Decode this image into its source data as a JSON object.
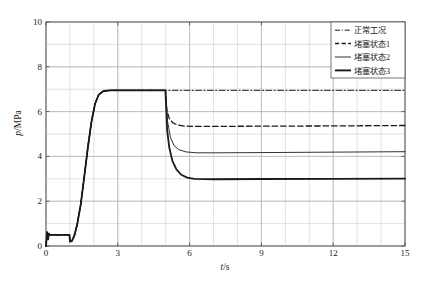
{
  "chart_data": {
    "type": "line",
    "title": "",
    "xlabel": "t/s",
    "ylabel": "p/MPa",
    "xlim": [
      0,
      15
    ],
    "ylim": [
      0,
      10
    ],
    "xticks": [
      0,
      3,
      6,
      9,
      12,
      15
    ],
    "yticks": [
      0,
      2,
      4,
      6,
      8,
      10
    ],
    "xtick_labels": [
      "0",
      "3",
      "6",
      "9",
      "12",
      "15"
    ],
    "ytick_labels": [
      "0",
      "2",
      "4",
      "6",
      "8",
      "10"
    ],
    "grid": true,
    "grid_minor_x_step": 1,
    "grid_minor_y_step": 1,
    "legend_position": "top-right",
    "units": {
      "x": "s",
      "y": "MPa"
    },
    "annotations": {
      "event_time_s": 5.0,
      "startup_plateau_mpa": 0.5,
      "steady_high_mpa": 6.95
    },
    "series": [
      {
        "name": "正常工况",
        "style": "dash-dot",
        "color": "#1a1a1a",
        "width": 1.0,
        "final_value": 6.95,
        "points": [
          [
            0.0,
            0.0
          ],
          [
            0.05,
            0.62
          ],
          [
            0.09,
            0.3
          ],
          [
            0.12,
            0.55
          ],
          [
            0.16,
            0.5
          ],
          [
            0.55,
            0.5
          ],
          [
            0.98,
            0.5
          ],
          [
            1.0,
            0.2
          ],
          [
            1.08,
            0.22
          ],
          [
            1.18,
            0.45
          ],
          [
            1.3,
            0.95
          ],
          [
            1.45,
            1.85
          ],
          [
            1.6,
            3.1
          ],
          [
            1.75,
            4.4
          ],
          [
            1.9,
            5.55
          ],
          [
            2.05,
            6.35
          ],
          [
            2.2,
            6.75
          ],
          [
            2.4,
            6.92
          ],
          [
            2.7,
            6.95
          ],
          [
            3.5,
            6.95
          ],
          [
            5.0,
            6.95
          ],
          [
            7.0,
            6.95
          ],
          [
            10.0,
            6.95
          ],
          [
            15.0,
            6.95
          ]
        ]
      },
      {
        "name": "堵塞状态1",
        "style": "dashed",
        "color": "#1a1a1a",
        "width": 1.3,
        "final_value": 5.35,
        "points": [
          [
            0.0,
            0.0
          ],
          [
            0.05,
            0.62
          ],
          [
            0.09,
            0.3
          ],
          [
            0.12,
            0.55
          ],
          [
            0.16,
            0.5
          ],
          [
            0.55,
            0.5
          ],
          [
            0.98,
            0.5
          ],
          [
            1.0,
            0.2
          ],
          [
            1.08,
            0.22
          ],
          [
            1.18,
            0.45
          ],
          [
            1.3,
            0.95
          ],
          [
            1.45,
            1.85
          ],
          [
            1.6,
            3.1
          ],
          [
            1.75,
            4.4
          ],
          [
            1.9,
            5.55
          ],
          [
            2.05,
            6.35
          ],
          [
            2.2,
            6.75
          ],
          [
            2.4,
            6.92
          ],
          [
            2.7,
            6.95
          ],
          [
            3.5,
            6.95
          ],
          [
            4.99,
            6.95
          ],
          [
            5.05,
            6.05
          ],
          [
            5.15,
            5.7
          ],
          [
            5.3,
            5.5
          ],
          [
            5.5,
            5.4
          ],
          [
            5.8,
            5.35
          ],
          [
            6.2,
            5.34
          ],
          [
            7.0,
            5.34
          ],
          [
            9.0,
            5.35
          ],
          [
            12.0,
            5.36
          ],
          [
            15.0,
            5.38
          ]
        ]
      },
      {
        "name": "堵塞状态2",
        "style": "solid",
        "color": "#1a1a1a",
        "width": 0.9,
        "final_value": 4.2,
        "points": [
          [
            0.0,
            0.0
          ],
          [
            0.05,
            0.62
          ],
          [
            0.09,
            0.3
          ],
          [
            0.12,
            0.55
          ],
          [
            0.16,
            0.5
          ],
          [
            0.55,
            0.5
          ],
          [
            0.98,
            0.5
          ],
          [
            1.0,
            0.2
          ],
          [
            1.08,
            0.22
          ],
          [
            1.18,
            0.45
          ],
          [
            1.3,
            0.95
          ],
          [
            1.45,
            1.85
          ],
          [
            1.6,
            3.1
          ],
          [
            1.75,
            4.4
          ],
          [
            1.9,
            5.55
          ],
          [
            2.05,
            6.35
          ],
          [
            2.2,
            6.75
          ],
          [
            2.4,
            6.92
          ],
          [
            2.7,
            6.95
          ],
          [
            3.5,
            6.95
          ],
          [
            4.99,
            6.95
          ],
          [
            5.08,
            5.55
          ],
          [
            5.2,
            4.85
          ],
          [
            5.35,
            4.48
          ],
          [
            5.55,
            4.3
          ],
          [
            5.85,
            4.2
          ],
          [
            6.3,
            4.16
          ],
          [
            7.0,
            4.16
          ],
          [
            9.0,
            4.17
          ],
          [
            12.0,
            4.19
          ],
          [
            15.0,
            4.21
          ]
        ]
      },
      {
        "name": "堵塞状态3",
        "style": "solid",
        "color": "#1a1a1a",
        "width": 1.8,
        "final_value": 3.0,
        "points": [
          [
            0.0,
            0.0
          ],
          [
            0.05,
            0.62
          ],
          [
            0.09,
            0.3
          ],
          [
            0.12,
            0.55
          ],
          [
            0.16,
            0.5
          ],
          [
            0.55,
            0.5
          ],
          [
            0.98,
            0.5
          ],
          [
            1.0,
            0.2
          ],
          [
            1.08,
            0.22
          ],
          [
            1.18,
            0.45
          ],
          [
            1.3,
            0.95
          ],
          [
            1.45,
            1.85
          ],
          [
            1.6,
            3.1
          ],
          [
            1.75,
            4.4
          ],
          [
            1.9,
            5.55
          ],
          [
            2.05,
            6.35
          ],
          [
            2.2,
            6.75
          ],
          [
            2.4,
            6.92
          ],
          [
            2.7,
            6.95
          ],
          [
            3.5,
            6.95
          ],
          [
            4.99,
            6.95
          ],
          [
            5.06,
            5.2
          ],
          [
            5.15,
            4.4
          ],
          [
            5.28,
            3.8
          ],
          [
            5.45,
            3.42
          ],
          [
            5.65,
            3.18
          ],
          [
            5.9,
            3.05
          ],
          [
            6.2,
            3.0
          ],
          [
            7.0,
            2.98
          ],
          [
            9.0,
            2.99
          ],
          [
            12.0,
            3.0
          ],
          [
            15.0,
            3.01
          ]
        ]
      }
    ]
  },
  "legend": {
    "items": [
      {
        "label": "正常工况",
        "style": "dash-dot"
      },
      {
        "label": "堵塞状态1",
        "style": "dashed"
      },
      {
        "label": "堵塞状态2",
        "style": "solid-thin"
      },
      {
        "label": "堵塞状态3",
        "style": "solid-thick"
      }
    ]
  },
  "axis": {
    "x_label_italic": "t",
    "x_label_rest": "/s",
    "y_label_italic": "p",
    "y_label_rest": "/MPa"
  },
  "colors": {
    "line": "#1a1a1a",
    "grid": "#c8c8c8",
    "axis": "#4d4d4d",
    "background": "#ffffff"
  }
}
